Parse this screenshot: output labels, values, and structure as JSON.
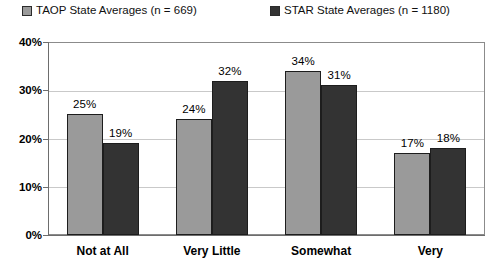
{
  "chart_data": {
    "type": "bar",
    "title": "",
    "xlabel": "",
    "ylabel": "",
    "ylim": [
      0,
      40
    ],
    "ytick_labels": [
      "0%",
      "10%",
      "20%",
      "30%",
      "40%"
    ],
    "ytick_values": [
      0,
      10,
      20,
      30,
      40
    ],
    "grid": true,
    "legend_position": "top",
    "categories": [
      "Not at All",
      "Very Little",
      "Somewhat",
      "Very"
    ],
    "series": [
      {
        "name": "TAOP State Averages (n = 669)",
        "color": "#9a9a9a",
        "values": [
          25,
          24,
          34,
          17
        ],
        "value_labels": [
          "25%",
          "24%",
          "34%",
          "17%"
        ]
      },
      {
        "name": "STAR State Averages (n = 1180)",
        "color": "#333333",
        "values": [
          19,
          32,
          31,
          18
        ],
        "value_labels": [
          "19%",
          "32%",
          "31%",
          "18%"
        ]
      }
    ]
  },
  "legend": {
    "entries": [
      {
        "label": "TAOP State Averages (n = 669)",
        "color": "#9a9a9a"
      },
      {
        "label": "STAR State Averages (n = 1180)",
        "color": "#333333"
      }
    ]
  },
  "colors": {
    "series_light": "#9a9a9a",
    "series_dark": "#333333",
    "gridline": "#c9c9c9",
    "axis": "#6d6d6d",
    "frame": "#8b8b8b",
    "background": "#ffffff",
    "text": "#000000"
  }
}
